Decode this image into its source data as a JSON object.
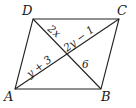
{
  "figure": {
    "shape": "parallelogram",
    "vertices": [
      {
        "name": "A",
        "x": 15,
        "y": 89,
        "label_x": 4,
        "label_y": 101
      },
      {
        "name": "B",
        "x": 101,
        "y": 89,
        "label_x": 101,
        "label_y": 101
      },
      {
        "name": "C",
        "x": 119,
        "y": 19,
        "label_x": 117,
        "label_y": 15
      },
      {
        "name": "D",
        "x": 33,
        "y": 19,
        "label_x": 22,
        "label_y": 15
      }
    ],
    "diagonals": [
      {
        "from": "A",
        "to": "C"
      },
      {
        "from": "D",
        "to": "B"
      }
    ],
    "segment_labels": [
      {
        "segment": "DE",
        "text": "2x",
        "x": 48,
        "y": 31,
        "rotate": 39
      },
      {
        "segment": "EC",
        "text": "2y − 1",
        "x": 66,
        "y": 49,
        "rotate": -37
      },
      {
        "segment": "AE",
        "text": "y + 3",
        "x": 32,
        "y": 73,
        "rotate": -37
      },
      {
        "segment": "EB",
        "text": "6",
        "x": 83,
        "y": 66,
        "rotate": 0
      }
    ],
    "vertex_labels": {
      "A": "A",
      "B": "B",
      "C": "C",
      "D": "D"
    }
  }
}
